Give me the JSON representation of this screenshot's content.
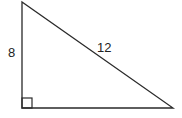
{
  "diagram": {
    "type": "right-triangle",
    "labels": {
      "vertical_leg": "8",
      "hypotenuse": "12"
    },
    "right_angle_marker": true,
    "colors": {
      "stroke": "#2a2a2a",
      "background": "#ffffff"
    }
  }
}
